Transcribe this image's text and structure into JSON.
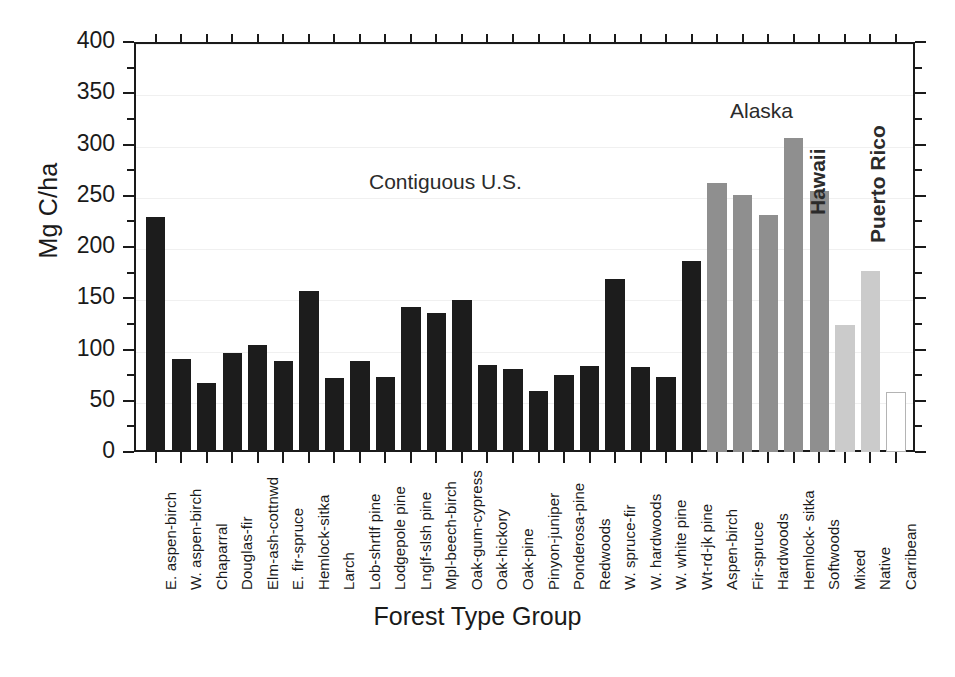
{
  "chart_data": {
    "type": "bar",
    "title": "",
    "xlabel": "Forest Type Group",
    "ylabel": "Mg C/ha",
    "ylim": [
      0,
      400
    ],
    "ytick_labels": [
      "0",
      "50",
      "100",
      "150",
      "200",
      "250",
      "300",
      "350",
      "400"
    ],
    "ytick_values": [
      0,
      50,
      100,
      150,
      200,
      250,
      300,
      350,
      400
    ],
    "ytick_minor_values": [
      25,
      75,
      125,
      175,
      225,
      275,
      325,
      375
    ],
    "grid": true,
    "legend": "none",
    "categories": [
      "E. aspen-birch",
      "W. aspen-birch",
      "Chaparral",
      "Douglas-fir",
      "Elm-ash-cottnwd",
      "E. fir-spruce",
      "Hemlock-sitka",
      "Larch",
      "Lob-shrtlf pine",
      "Lodgepole pine",
      "Lnglf-slsh pine",
      "Mpl-beech-birch",
      "Oak-gum-cypress",
      "Oak-hickory",
      "Oak-pine",
      "Pinyon-juniper",
      "Ponderosa-pine",
      "Redwoods",
      "W. spruce-fir",
      "W. hardwoods",
      "W. white pine",
      "Wt-rd-jk pine",
      "Aspen-birch",
      "Fir-spruce",
      "Hardwoods",
      "Hemlock- sitka",
      "Softwoods",
      "Mixed",
      "Native",
      "Carribean"
    ],
    "values": [
      229,
      91,
      67,
      97,
      104,
      89,
      157,
      72,
      89,
      73,
      141,
      136,
      148,
      85,
      81,
      60,
      75,
      84,
      169,
      83,
      73,
      186,
      262,
      251,
      231,
      306,
      255,
      124,
      177,
      0
    ],
    "regions": [
      "contiguous",
      "contiguous",
      "contiguous",
      "contiguous",
      "contiguous",
      "contiguous",
      "contiguous",
      "contiguous",
      "contiguous",
      "contiguous",
      "contiguous",
      "contiguous",
      "contiguous",
      "contiguous",
      "contiguous",
      "contiguous",
      "contiguous",
      "contiguous",
      "contiguous",
      "contiguous",
      "contiguous",
      "contiguous",
      "alaska",
      "alaska",
      "alaska",
      "alaska",
      "alaska",
      "hawaii",
      "hawaii",
      "puertorico"
    ],
    "region_colors": {
      "contiguous": "#1c1c1c",
      "alaska": "#8f8f8f",
      "hawaii": "#cbcbcb",
      "puertorico": "#ffffff"
    },
    "annotations": [
      {
        "text": "Contiguous U.S.",
        "orientation": "horizontal",
        "x": 369,
        "y": 170
      },
      {
        "text": "Alaska",
        "orientation": "horizontal",
        "x": 730,
        "y": 99
      },
      {
        "text": "Hawaii",
        "orientation": "vertical",
        "x": 806,
        "y": 215
      },
      {
        "text": "Puerto Rico",
        "orientation": "vertical",
        "x": 866,
        "y": 243
      }
    ]
  }
}
